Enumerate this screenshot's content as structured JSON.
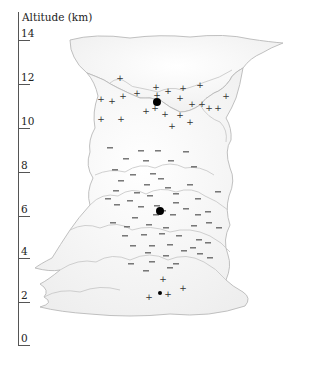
{
  "axis": {
    "title": "Altitude (km)",
    "ticks": [
      {
        "label": "14",
        "y": 40
      },
      {
        "label": "12",
        "y": 84
      },
      {
        "label": "10",
        "y": 128
      },
      {
        "label": "8",
        "y": 172
      },
      {
        "label": "6",
        "y": 216
      },
      {
        "label": "4",
        "y": 258
      },
      {
        "label": "2",
        "y": 302
      },
      {
        "label": "0",
        "y": 345
      }
    ]
  },
  "charge_regions": {
    "upper_positive": {
      "symbol": "+",
      "center": {
        "x": 157,
        "y": 102
      },
      "altitude_km": 11
    },
    "middle_negative": {
      "symbol": "−",
      "center": {
        "x": 160,
        "y": 211
      },
      "altitude_km": 6
    },
    "lower_positive": {
      "symbol": "+",
      "center": {
        "x": 160,
        "y": 293
      },
      "altitude_km": 2.5
    }
  },
  "markers": {
    "plus": [
      [
        120,
        78
      ],
      [
        101,
        99
      ],
      [
        112,
        101
      ],
      [
        123,
        96
      ],
      [
        137,
        93
      ],
      [
        156,
        87
      ],
      [
        168,
        91
      ],
      [
        183,
        88
      ],
      [
        200,
        85
      ],
      [
        146,
        111
      ],
      [
        155,
        108
      ],
      [
        157,
        95
      ],
      [
        180,
        98
      ],
      [
        192,
        104
      ],
      [
        202,
        104
      ],
      [
        209,
        108
      ],
      [
        218,
        108
      ],
      [
        226,
        96
      ],
      [
        101,
        119
      ],
      [
        121,
        119
      ],
      [
        165,
        114
      ],
      [
        180,
        115
      ],
      [
        190,
        122
      ],
      [
        172,
        126
      ],
      [
        163,
        279
      ],
      [
        149,
        297
      ],
      [
        168,
        294
      ],
      [
        183,
        288
      ]
    ],
    "minus": [
      [
        110,
        148
      ],
      [
        141,
        151
      ],
      [
        158,
        151
      ],
      [
        186,
        152
      ],
      [
        126,
        159
      ],
      [
        146,
        161
      ],
      [
        171,
        161
      ],
      [
        194,
        167
      ],
      [
        115,
        170
      ],
      [
        133,
        175
      ],
      [
        153,
        174
      ],
      [
        161,
        179
      ],
      [
        121,
        181
      ],
      [
        147,
        185
      ],
      [
        168,
        188
      ],
      [
        190,
        185
      ],
      [
        116,
        191
      ],
      [
        137,
        193
      ],
      [
        150,
        196
      ],
      [
        176,
        194
      ],
      [
        218,
        192
      ],
      [
        108,
        199
      ],
      [
        130,
        201
      ],
      [
        157,
        206
      ],
      [
        176,
        203
      ],
      [
        198,
        199
      ],
      [
        117,
        205
      ],
      [
        141,
        207
      ],
      [
        163,
        211
      ],
      [
        186,
        209
      ],
      [
        208,
        212
      ],
      [
        135,
        218
      ],
      [
        156,
        215
      ],
      [
        173,
        215
      ],
      [
        198,
        215
      ],
      [
        113,
        223
      ],
      [
        127,
        227
      ],
      [
        149,
        225
      ],
      [
        166,
        228
      ],
      [
        194,
        226
      ],
      [
        209,
        223
      ],
      [
        219,
        228
      ],
      [
        125,
        236
      ],
      [
        144,
        235
      ],
      [
        162,
        234
      ],
      [
        179,
        236
      ],
      [
        199,
        240
      ],
      [
        133,
        246
      ],
      [
        152,
        246
      ],
      [
        170,
        245
      ],
      [
        193,
        248
      ],
      [
        208,
        243
      ],
      [
        148,
        253
      ],
      [
        166,
        256
      ],
      [
        184,
        251
      ],
      [
        200,
        254
      ],
      [
        131,
        264
      ],
      [
        152,
        262
      ],
      [
        176,
        264
      ],
      [
        210,
        258
      ],
      [
        146,
        271
      ],
      [
        170,
        268
      ]
    ],
    "dots": [
      {
        "x": 157,
        "y": 102,
        "r": 4
      },
      {
        "x": 160,
        "y": 211,
        "r": 4
      },
      {
        "x": 160,
        "y": 293,
        "r": 2
      }
    ]
  }
}
